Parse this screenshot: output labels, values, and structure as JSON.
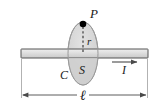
{
  "figure": {
    "labels": {
      "point_P": "P",
      "radius_r": "r",
      "curve_C": "C",
      "surface_S": "S",
      "current_I": "I",
      "length_ell": "ℓ"
    },
    "colors": {
      "background": "#ffffff",
      "rod_fill": "#d9d9d9",
      "rod_stroke": "#4a4a4a",
      "ellipse_fill": "#d6d6d6",
      "ellipse_stroke": "#8c8c8c",
      "point_fill": "#000000",
      "dimension_line": "#5a5a5a",
      "dashed_line": "#333333",
      "label_color": "#1a1a1a"
    },
    "geometry": {
      "rod": {
        "x": 21,
        "y": 49,
        "width": 127,
        "height": 9
      },
      "ellipse": {
        "cx": 83,
        "cy": 53.5,
        "rx": 15,
        "ry": 31.5
      },
      "point": {
        "cx": 83,
        "cy": 24,
        "r": 3.2
      },
      "dimension": {
        "x1": 21,
        "x2": 148,
        "y": 95
      },
      "current_arrow": {
        "x1": 112,
        "x2": 139,
        "y": 64
      },
      "dashed": {
        "x": 83,
        "y1": 27,
        "y2": 53
      }
    }
  }
}
